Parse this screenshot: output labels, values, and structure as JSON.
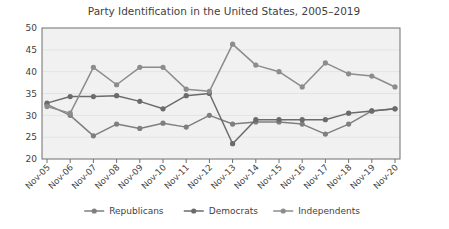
{
  "chart_data": {
    "type": "line",
    "title": "Party Identification in the United States, 2005–2019",
    "xlabel": "",
    "ylabel": "",
    "ylim": [
      20,
      50
    ],
    "ytick_step": 5,
    "yticks": [
      20,
      25,
      30,
      35,
      40,
      45,
      50
    ],
    "grid": true,
    "legend_position": "bottom",
    "categories": [
      "Nov-05",
      "Nov-06",
      "Nov-07",
      "Nov-08",
      "Nov-09",
      "Nov-10",
      "Nov-11",
      "Nov-12",
      "Nov-13",
      "Nov-14",
      "Nov-15",
      "Nov-16",
      "Nov-17",
      "Nov-18",
      "Nov-19",
      "Nov-20"
    ],
    "series": [
      {
        "name": "Republicans",
        "color": "#7f7f7f",
        "values": [
          32.5,
          30.0,
          25.3,
          28.0,
          27.0,
          28.2,
          27.3,
          30.0,
          28.0,
          28.5,
          28.5,
          28.0,
          25.7,
          28.0,
          31.0,
          31.5
        ]
      },
      {
        "name": "Democrats",
        "color": "#6b6b6b",
        "values": [
          32.8,
          34.3,
          34.3,
          34.5,
          33.2,
          31.5,
          34.5,
          35.0,
          23.5,
          29.0,
          29.0,
          29.0,
          29.0,
          30.5,
          31.0,
          31.5
        ]
      },
      {
        "name": "Independents",
        "color": "#8c8c8c",
        "values": [
          32.0,
          30.5,
          41.0,
          37.0,
          41.0,
          41.0,
          36.0,
          35.5,
          46.3,
          41.5,
          40.0,
          36.5,
          42.0,
          39.5,
          39.0,
          36.5
        ]
      }
    ]
  },
  "legend": {
    "items": [
      {
        "label": "Republicans"
      },
      {
        "label": "Democrats"
      },
      {
        "label": "Independents"
      }
    ]
  }
}
